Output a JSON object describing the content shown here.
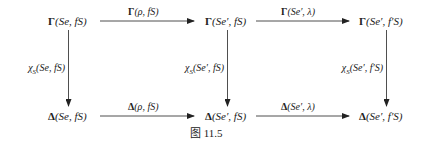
{
  "figure": {
    "caption": "图 11.5",
    "nodes": {
      "top_left": {
        "op": "Γ",
        "args": "(Se, fS)"
      },
      "top_mid": {
        "op": "Γ",
        "args": "(Se′, fS)"
      },
      "top_right": {
        "op": "Γ",
        "args": "(Se′, f′S)"
      },
      "bot_left": {
        "op": "Δ",
        "args": "(Se, fS)"
      },
      "bot_mid": {
        "op": "Δ",
        "args": "(Se′, fS)"
      },
      "bot_right": {
        "op": "Δ",
        "args": "(Se′, f′S)"
      }
    },
    "horizontal_arrows": {
      "top_1": {
        "op": "Γ",
        "args": "(ρ, fS)"
      },
      "top_2": {
        "op": "Γ",
        "args": "(Se′, λ)"
      },
      "bot_1": {
        "op": "Δ",
        "args": "(ρ, fS)"
      },
      "bot_2": {
        "op": "Δ",
        "args": "(Se′, λ)"
      }
    },
    "vertical_arrows": {
      "left": {
        "op": "χ",
        "sub": "S",
        "args": "(Se, fS)"
      },
      "mid": {
        "op": "χ",
        "sub": "S",
        "args": "(Se′, fS)"
      },
      "right": {
        "op": "χ",
        "sub": "S",
        "args": "(Se′, f′S)"
      }
    },
    "colors": {
      "ink": "#222222",
      "background": "#ffffff"
    }
  }
}
